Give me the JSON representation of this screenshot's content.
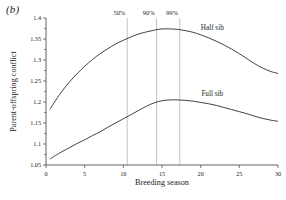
{
  "figure": {
    "panel_label": "(b)",
    "background_color": "#ffffff",
    "curve_color": "#2b2b2b",
    "axis_color": "#3c3c3c",
    "vline_color": "#9a9a9a"
  },
  "chart_data": {
    "type": "line",
    "title": "",
    "subtitle": "",
    "panel": "(b)",
    "xlabel": "Breeding season",
    "ylabel": "Parent-offspring conflict",
    "xlim": [
      0,
      30
    ],
    "ylim": [
      1.05,
      1.4
    ],
    "grid": false,
    "legend_position": "inline-curve-labels",
    "x_ticks": [
      0,
      5,
      10,
      15,
      20,
      25,
      30
    ],
    "x_tick_labels": [
      "0",
      "5",
      "10",
      "15",
      "20",
      "25",
      "30"
    ],
    "y_ticks": [
      1.05,
      1.1,
      1.15,
      1.2,
      1.25,
      1.3,
      1.35,
      1.4
    ],
    "y_tick_labels": [
      "1.05",
      "1.1",
      "1.15",
      "1.2",
      "1.25",
      "1.3",
      "1.35",
      "1.4"
    ],
    "y_minor_ticks": [
      1.075,
      1.125,
      1.175,
      1.225,
      1.275,
      1.325,
      1.375
    ],
    "series": [
      {
        "name": "Half sib",
        "label": "Half sib",
        "label_x": 21.5,
        "label_y": 1.372,
        "x": [
          0.5,
          1,
          2,
          3,
          4,
          5,
          6,
          7,
          8,
          9,
          10,
          11,
          12,
          13,
          14,
          15,
          16,
          17,
          18,
          19,
          20,
          21,
          22,
          23,
          24,
          25,
          26,
          27,
          28,
          29,
          30
        ],
        "values": [
          1.182,
          1.197,
          1.224,
          1.247,
          1.267,
          1.285,
          1.301,
          1.315,
          1.327,
          1.338,
          1.347,
          1.355,
          1.362,
          1.367,
          1.371,
          1.374,
          1.374,
          1.373,
          1.37,
          1.366,
          1.36,
          1.353,
          1.345,
          1.336,
          1.326,
          1.315,
          1.303,
          1.291,
          1.281,
          1.273,
          1.268
        ]
      },
      {
        "name": "Full sib",
        "label": "Full sib",
        "label_x": 21.5,
        "label_y": 1.215,
        "x": [
          0.5,
          1,
          2,
          3,
          4,
          5,
          6,
          7,
          8,
          9,
          10,
          11,
          12,
          13,
          14,
          15,
          16,
          17,
          18,
          19,
          20,
          21,
          22,
          23,
          24,
          25,
          26,
          27,
          28,
          29,
          30
        ],
        "values": [
          1.064,
          1.07,
          1.081,
          1.091,
          1.101,
          1.11,
          1.12,
          1.129,
          1.14,
          1.15,
          1.16,
          1.17,
          1.18,
          1.19,
          1.198,
          1.203,
          1.205,
          1.205,
          1.204,
          1.202,
          1.199,
          1.196,
          1.192,
          1.187,
          1.182,
          1.177,
          1.172,
          1.166,
          1.161,
          1.157,
          1.154
        ]
      }
    ],
    "annotations": [
      {
        "label": "50%",
        "x": 10.5,
        "line_top": 1.4,
        "line_bottom": 1.05
      },
      {
        "label": "90%",
        "x": 14.3,
        "line_top": 1.4,
        "line_bottom": 1.05
      },
      {
        "label": "99%",
        "x": 17.3,
        "line_top": 1.4,
        "line_bottom": 1.05
      }
    ]
  }
}
